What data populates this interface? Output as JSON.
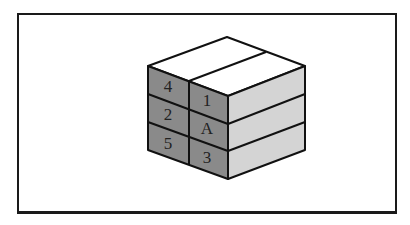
{
  "figure": {
    "type": "isometric cube diagram",
    "colors": {
      "top": "#ffffff",
      "left_face": "#8a8a8a",
      "right_face": "#d4d4d4",
      "edges": "#111111",
      "frame": "#1a1a1a"
    },
    "left_face_labels": {
      "col1": [
        "4",
        "2",
        "5"
      ],
      "col2": [
        "1",
        "A",
        "3"
      ]
    }
  }
}
